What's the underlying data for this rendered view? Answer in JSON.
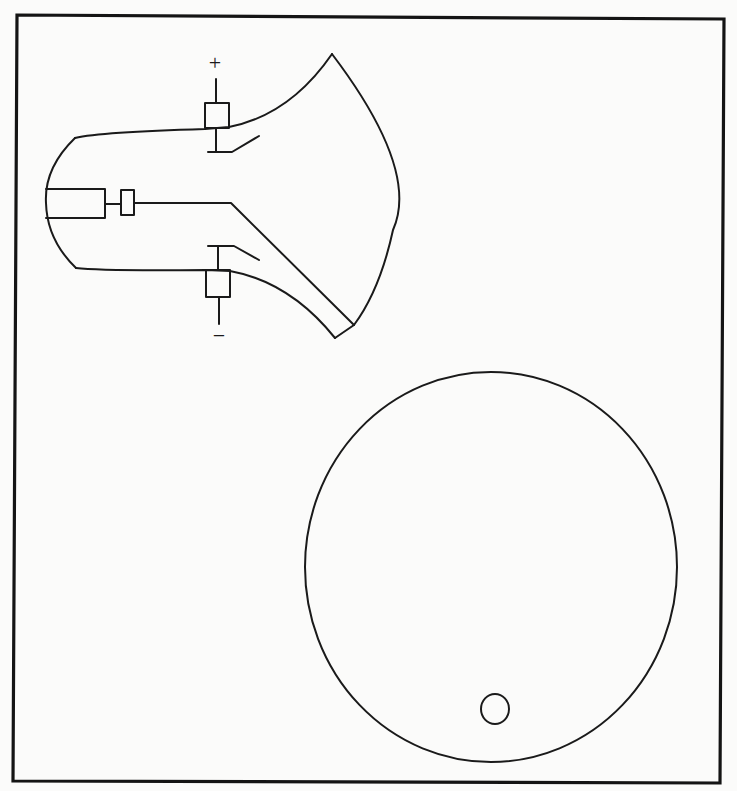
{
  "figure": {
    "type": "cathode-ray-tube schematic with screen view",
    "colors": {
      "background": "#fbfbfa",
      "line": "#1a1a1a",
      "frame": "#141414"
    }
  },
  "crt": {
    "labels": {
      "top_plate_polarity": "+",
      "bottom_plate_polarity": "−"
    },
    "components": [
      "tube-envelope",
      "cathode",
      "control-grid",
      "electron-beam",
      "upper-deflection-plate",
      "lower-deflection-plate",
      "fluorescent-screen"
    ]
  },
  "screen_view": {
    "shape": "circle",
    "spot": {
      "shape": "small-circle",
      "position": "lower-center"
    }
  }
}
